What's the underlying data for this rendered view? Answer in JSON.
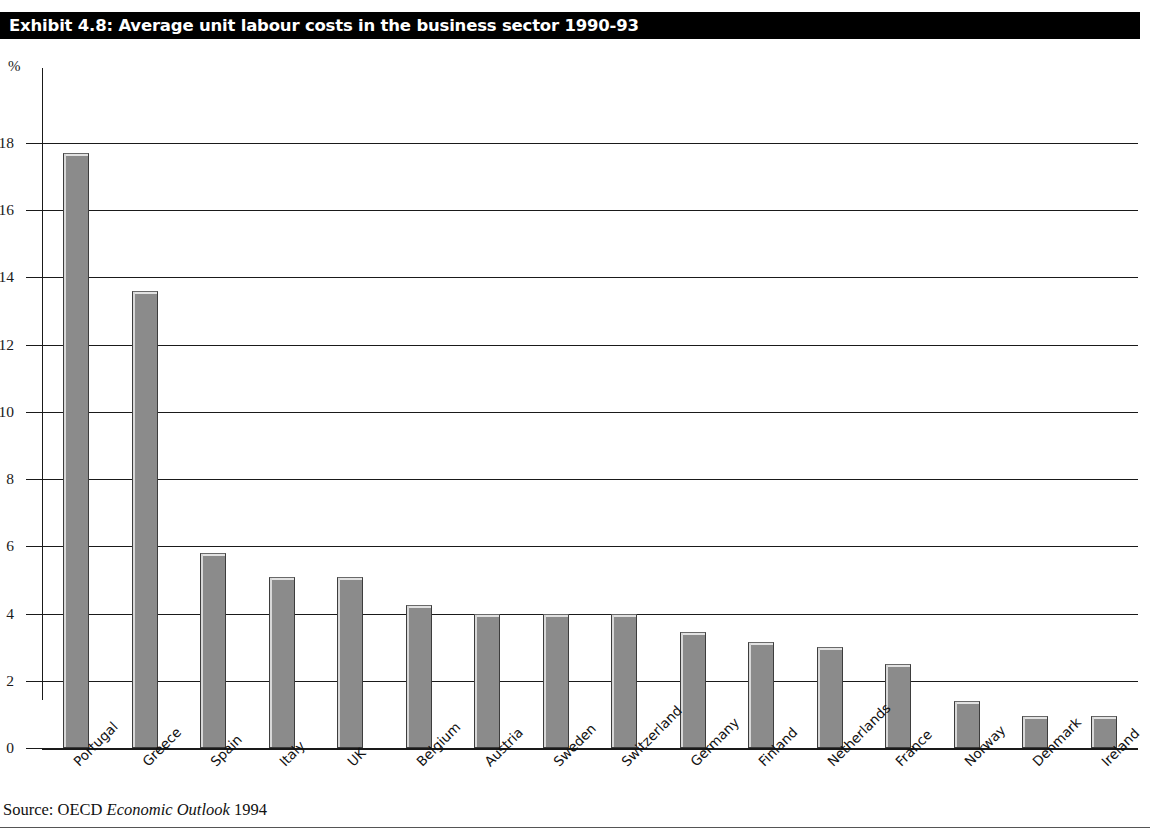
{
  "title": "Exhibit 4.8: Average unit labour costs in the business sector 1990-93",
  "source": {
    "prefix": "Source: OECD ",
    "italic": "Economic Outlook",
    "suffix": " 1994"
  },
  "colors": {
    "banner_background": "#000000",
    "banner_text": "#ffffff",
    "bar_fill": "#8b8b8b",
    "bar_border": "#3d3d3d",
    "bar_highlight": "#d8d8d8",
    "axis": "#1a1a1a",
    "page_background": "#ffffff"
  },
  "chart_data": {
    "type": "bar",
    "title": "Exhibit 4.8: Average unit labour costs in the business sector 1990-93",
    "xlabel": "",
    "ylabel": "%",
    "ylim": [
      0,
      18
    ],
    "yticks": [
      0,
      2,
      4,
      6,
      8,
      10,
      12,
      14,
      16,
      18
    ],
    "ytick_labels": [
      "0",
      "2",
      "4",
      "6",
      "8",
      "10",
      "12",
      "14",
      "16",
      "18"
    ],
    "grid": true,
    "legend": false,
    "categories": [
      "Portugal",
      "Greece",
      "Spain",
      "Italy",
      "UK",
      "Belgium",
      "Austria",
      "Sweden",
      "Switzerland",
      "Germany",
      "Finland",
      "Netherlands",
      "France",
      "Norway",
      "Denmark",
      "Ireland"
    ],
    "values": [
      17.7,
      13.6,
      5.8,
      5.1,
      5.1,
      4.25,
      4.0,
      4.0,
      4.0,
      3.45,
      3.15,
      3.0,
      2.5,
      1.4,
      0.95,
      0.95
    ]
  }
}
